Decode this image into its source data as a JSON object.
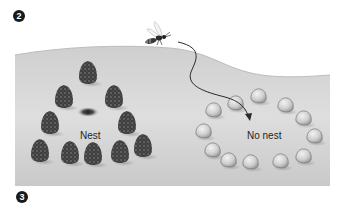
{
  "figure": {
    "step_markers": [
      {
        "label": "2",
        "x": 13,
        "y": 10
      },
      {
        "label": "3",
        "x": 16,
        "y": 191
      }
    ],
    "labels": {
      "nest": "Nest",
      "no_nest": "No nest"
    },
    "colors": {
      "ground_light": "#e2e2e2",
      "ground_dark": "#b9b9b9",
      "pinecone": "#4a4a4a",
      "stone_fill": "#d6d6d6",
      "stone_outline": "#777777",
      "flight_path": "#2a2a2a",
      "marker_bg": "#1a1a1a"
    },
    "elements": {
      "wasp": {
        "x": 160,
        "y": 38
      },
      "nest_hole": {
        "x": 88,
        "y": 112
      },
      "pinecones": [
        {
          "x": 88,
          "y": 72
        },
        {
          "x": 64,
          "y": 96
        },
        {
          "x": 114,
          "y": 96
        },
        {
          "x": 50,
          "y": 122
        },
        {
          "x": 127,
          "y": 122
        },
        {
          "x": 40,
          "y": 150
        },
        {
          "x": 70,
          "y": 152
        },
        {
          "x": 93,
          "y": 153
        },
        {
          "x": 120,
          "y": 151
        },
        {
          "x": 143,
          "y": 145
        }
      ],
      "stones": [
        {
          "x": 258,
          "y": 96
        },
        {
          "x": 235,
          "y": 103
        },
        {
          "x": 285,
          "y": 105
        },
        {
          "x": 213,
          "y": 110
        },
        {
          "x": 303,
          "y": 118
        },
        {
          "x": 203,
          "y": 131
        },
        {
          "x": 314,
          "y": 136
        },
        {
          "x": 212,
          "y": 150
        },
        {
          "x": 228,
          "y": 160
        },
        {
          "x": 250,
          "y": 162
        },
        {
          "x": 280,
          "y": 161
        },
        {
          "x": 303,
          "y": 156
        }
      ]
    }
  }
}
